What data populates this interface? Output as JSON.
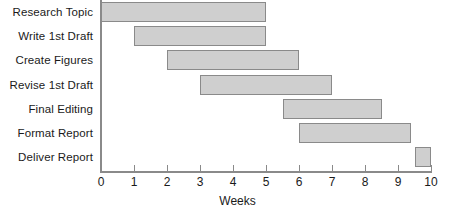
{
  "chart_data": {
    "type": "bar",
    "subtype": "gantt",
    "title": "",
    "xlabel": "Weeks",
    "ylabel": "",
    "xlim": [
      0,
      10
    ],
    "xticks": [
      "0",
      "1",
      "2",
      "3",
      "4",
      "5",
      "6",
      "7",
      "8",
      "9",
      "10"
    ],
    "grid": false,
    "legend": null,
    "orientation": "horizontal",
    "bar_fill_color": "#cfcfcf",
    "bar_border_color": "#8a8a8a",
    "axis_color": "#8a8a8a",
    "categories": [
      "Research Topic",
      "Write 1st Draft",
      "Create Figures",
      "Revise 1st Draft",
      "Final Editing",
      "Format Report",
      "Deliver Report"
    ],
    "tasks": [
      {
        "label": "Research Topic",
        "start": 0,
        "end": 5,
        "duration": 5
      },
      {
        "label": "Write 1st Draft",
        "start": 1,
        "end": 5,
        "duration": 4
      },
      {
        "label": "Create Figures",
        "start": 2,
        "end": 6,
        "duration": 4
      },
      {
        "label": "Revise 1st Draft",
        "start": 3,
        "end": 7,
        "duration": 4
      },
      {
        "label": "Final Editing",
        "start": 5.5,
        "end": 8.5,
        "duration": 3
      },
      {
        "label": "Format Report",
        "start": 6,
        "end": 9.4,
        "duration": 3.4
      },
      {
        "label": "Deliver Report",
        "start": 9.5,
        "end": 10,
        "duration": 0.5
      }
    ]
  }
}
